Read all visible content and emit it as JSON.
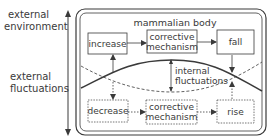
{
  "diagram": {
    "left_labels": {
      "top": [
        "external",
        "environment"
      ],
      "bottom": [
        "external",
        "fluctuations"
      ]
    },
    "container_title": "mammalian body",
    "top_row": {
      "left_box": "increase",
      "middle_box": [
        "corrective",
        "mechanism"
      ],
      "right_box": "fall"
    },
    "middle_label": [
      "internal",
      "fluctuations"
    ],
    "bottom_row": {
      "left_box": "decrease",
      "middle_box": [
        "corrective",
        "mechanism"
      ],
      "right_box": "rise"
    },
    "colors": {
      "stroke": "#3a3a3a",
      "background": "#ffffff"
    }
  }
}
